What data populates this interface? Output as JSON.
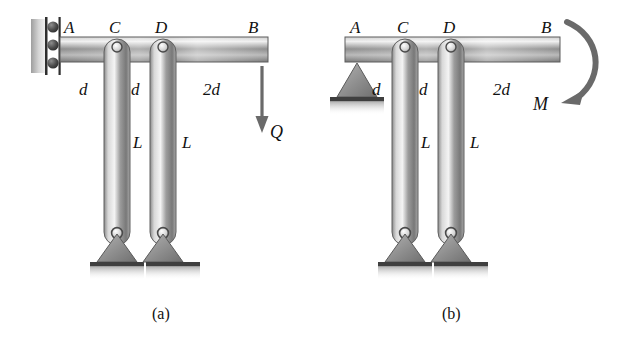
{
  "figure": {
    "caption_a": "(a)",
    "caption_b": "(b)",
    "panel_a": {
      "name": "beam-with-point-load",
      "joint_labels": {
        "a": "A",
        "c": "C",
        "d": "D",
        "b": "B"
      },
      "dimensions": {
        "ac": "d",
        "cd": "d",
        "db": "2d"
      },
      "column_labels": {
        "left": "L",
        "right": "L"
      },
      "load_label": "Q",
      "support_left": "roller-wall-support",
      "support_columns": "pinned-triangle-support"
    },
    "panel_b": {
      "name": "beam-with-applied-moment",
      "joint_labels": {
        "a": "A",
        "c": "C",
        "d": "D",
        "b": "B"
      },
      "dimensions": {
        "ac": "d",
        "cd": "d",
        "db": "2d"
      },
      "column_labels": {
        "left": "L",
        "right": "L"
      },
      "load_label": "M",
      "support_left": "pinned-triangle-support",
      "support_columns": "pinned-triangle-support"
    }
  },
  "colors": {
    "ink": "#111111",
    "steel_light": "#f2f2f2",
    "steel_mid": "#9a9a9a",
    "steel_dark": "#6e6e6e",
    "support_fill": "#8d8d8d",
    "ground": "#4a4a4a"
  }
}
